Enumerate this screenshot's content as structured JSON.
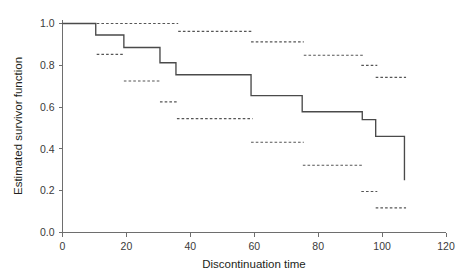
{
  "chart_data": {
    "type": "line",
    "title": "",
    "subtitle": "",
    "xlabel": "Discontinuation time",
    "ylabel": "Estimated survivor function",
    "xlim": [
      0,
      120
    ],
    "ylim": [
      0.0,
      1.0
    ],
    "xticks": [
      0,
      20,
      40,
      60,
      80,
      100,
      120
    ],
    "xtick_labels": [
      "0",
      "20",
      "40",
      "60",
      "80",
      "100",
      "120"
    ],
    "yticks": [
      0.0,
      0.2,
      0.4,
      0.6,
      0.8,
      1.0
    ],
    "ytick_labels": [
      "0.0",
      "0.2",
      "0.4",
      "0.6",
      "0.8",
      "1.0"
    ],
    "grid": false,
    "legend": null,
    "series": [
      {
        "name": "Kaplan-Meier estimate",
        "style": "step",
        "line_style": "solid",
        "color": "#4a4a4a",
        "x": [
          0,
          10.4,
          10.4,
          19.2,
          19.2,
          30.5,
          30.5,
          35.5,
          35.5,
          59.0,
          59.0,
          75.0,
          75.0,
          93.8,
          93.8,
          98.0,
          98.0,
          107.0,
          107.0
        ],
        "y": [
          1.0,
          1.0,
          0.945,
          0.945,
          0.885,
          0.885,
          0.812,
          0.812,
          0.755,
          0.755,
          0.655,
          0.655,
          0.578,
          0.578,
          0.54,
          0.54,
          0.46,
          0.46,
          0.25
        ]
      },
      {
        "name": "95% confidence band (upper)",
        "style": "segments",
        "line_style": "dashed",
        "color": "#555555",
        "segments": [
          {
            "x0": 10.7,
            "x1": 36.2,
            "y": 1.0
          },
          {
            "x0": 36.2,
            "x1": 59.5,
            "y": 0.962
          },
          {
            "x0": 59.0,
            "x1": 75.5,
            "y": 0.912
          },
          {
            "x0": 75.5,
            "x1": 94.0,
            "y": 0.848
          },
          {
            "x0": 93.5,
            "x1": 98.5,
            "y": 0.8
          },
          {
            "x0": 98.0,
            "x1": 107.5,
            "y": 0.742
          }
        ]
      },
      {
        "name": "95% confidence band (lower)",
        "style": "segments",
        "line_style": "dashed",
        "color": "#555555",
        "segments": [
          {
            "x0": 10.7,
            "x1": 19.5,
            "y": 0.852
          },
          {
            "x0": 19.2,
            "x1": 30.8,
            "y": 0.725
          },
          {
            "x0": 30.5,
            "x1": 36.0,
            "y": 0.625
          },
          {
            "x0": 35.8,
            "x1": 59.5,
            "y": 0.545
          },
          {
            "x0": 59.0,
            "x1": 75.5,
            "y": 0.432
          },
          {
            "x0": 75.2,
            "x1": 94.0,
            "y": 0.322
          },
          {
            "x0": 93.5,
            "x1": 98.5,
            "y": 0.196
          },
          {
            "x0": 98.0,
            "x1": 107.5,
            "y": 0.118
          }
        ]
      }
    ]
  },
  "axes": {
    "x_title": "Discontinuation time",
    "y_title": "Estimated survivor function"
  }
}
